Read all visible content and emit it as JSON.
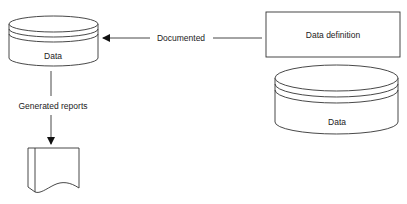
{
  "diagram": {
    "nodes": {
      "data_store_left": {
        "label": "Data",
        "shape": "cylinder"
      },
      "data_definition": {
        "label": "Data definition",
        "shape": "rectangle"
      },
      "data_store_right": {
        "label": "Data",
        "shape": "cylinder"
      },
      "report": {
        "label": "",
        "shape": "document"
      }
    },
    "edges": {
      "documented": {
        "label": "Documented",
        "from": "data_definition",
        "to": "data_store_left"
      },
      "generated_reports": {
        "label": "Generated reports",
        "from": "data_store_left",
        "to": "report"
      }
    },
    "colors": {
      "stroke": "#333333",
      "text": "#222222",
      "background": "#ffffff"
    }
  }
}
